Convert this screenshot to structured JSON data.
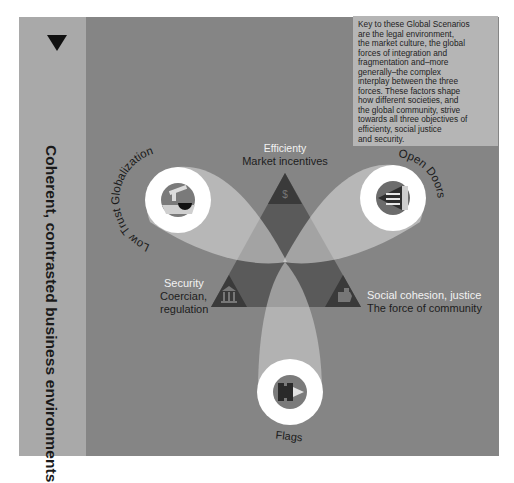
{
  "sidebar": {
    "arrow_icon": "triangle-down-icon",
    "title": "Coherent, contrasted business environments"
  },
  "key_box": {
    "text": "Key to these Global Scenarios are the legal environment, the market culture, the global forces of integration and fragmentation and–more generally–the complex interplay between the three forces. These factors shape how different societies, and the global community, strive towards all three objectives of efficienty, social justice and security.",
    "lines": [
      "Key to these Global Scenarios",
      "are the legal environment,",
      "the market culture, the global",
      "forces of integration and",
      "fragmentation and–more",
      "generally–the complex",
      "interplay between the three",
      "forces. These factors shape",
      "how different societies, and",
      "the global community, strive",
      "towards all three objectives of",
      "efficienty, social justice",
      "and security."
    ]
  },
  "forces": {
    "efficiency": {
      "title": "Efficienty",
      "subtitle": "Market incentives",
      "icon": "dollar-icon"
    },
    "security": {
      "title": "Security",
      "subtitle_line1": "Coercian,",
      "subtitle_line2": "regulation",
      "icon": "bank-building-icon"
    },
    "social": {
      "title": "Social cohesion, justice",
      "subtitle": "The force of community",
      "icon": "handshake-icon"
    }
  },
  "scenarios": [
    {
      "name": "Low Trust Globalization",
      "icon": "faucet-icon"
    },
    {
      "name": "Open Doors",
      "icon": "open-door-icon"
    },
    {
      "name": "Flags",
      "icon": "flag-fortress-icon"
    }
  ],
  "colors": {
    "page_bg": "#ffffff",
    "sidebar_bg": "#a9a9a9",
    "main_bg": "#858585",
    "key_box_bg": "#b5b5b5",
    "triangle_dark": "#3b3b3b",
    "beam_light": "#d4d4d4",
    "ring_white": "#ffffff"
  }
}
